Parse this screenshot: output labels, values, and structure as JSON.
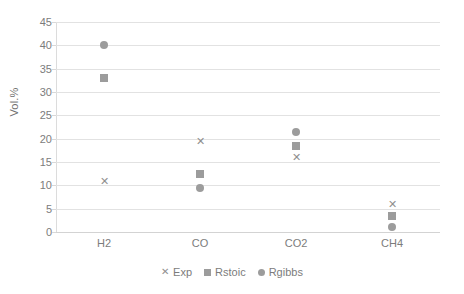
{
  "chart_data": {
    "type": "scatter",
    "title": "",
    "xlabel": "",
    "ylabel": "Vol.%",
    "categories": [
      "H2",
      "CO",
      "CO2",
      "CH4"
    ],
    "ylim": [
      0,
      45
    ],
    "ytick_step": 5,
    "yticks": [
      45,
      40,
      35,
      30,
      25,
      20,
      15,
      10,
      5,
      0
    ],
    "ytick_labels": [
      "45",
      "40",
      "35",
      "30",
      "25",
      "20",
      "15",
      "10",
      "5",
      "0"
    ],
    "grid": true,
    "legend_position": "bottom",
    "marker_color": "#9a9a9a",
    "gridline_color": "#e2e2e2",
    "series": [
      {
        "name": "Exp",
        "marker": "cross",
        "glyph": "✕",
        "values": [
          11,
          19.5,
          16,
          6
        ]
      },
      {
        "name": "Rstoic",
        "marker": "square",
        "glyph": "■",
        "values": [
          33,
          12.5,
          18.5,
          3.5
        ]
      },
      {
        "name": "Rgibbs",
        "marker": "circle",
        "glyph": "●",
        "values": [
          40,
          9.5,
          21.5,
          1
        ]
      }
    ]
  },
  "legend": {
    "items": [
      {
        "label": "Exp",
        "marker": "cross",
        "glyph": "✕"
      },
      {
        "label": "Rstoic",
        "marker": "square",
        "glyph": ""
      },
      {
        "label": "Rgibbs",
        "marker": "circle",
        "glyph": ""
      }
    ]
  },
  "axis": {
    "y_title": "Vol.%"
  }
}
